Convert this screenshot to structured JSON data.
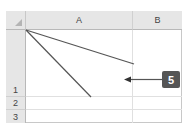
{
  "spreadsheet": {
    "columns": [
      {
        "label": "A"
      },
      {
        "label": "B"
      }
    ],
    "rows": [
      {
        "label": "1"
      },
      {
        "label": "2"
      },
      {
        "label": "3"
      }
    ],
    "cell_A1": {
      "content": "diagonal border lines drawn from top-left corner"
    }
  },
  "callout": {
    "number": "5",
    "color": "#555555"
  },
  "colors": {
    "header_bg": "#e6e6e6",
    "gridline": "#e0e0e0",
    "diagonal_line": "#555555"
  }
}
